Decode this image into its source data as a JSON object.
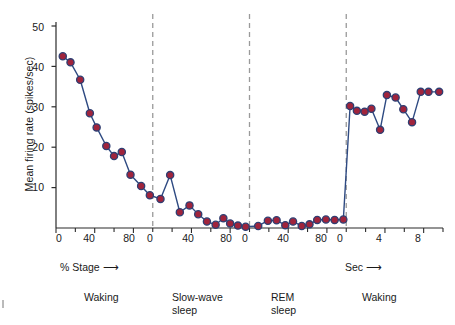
{
  "chart_data": {
    "type": "line",
    "title": "",
    "xlabel": "",
    "ylabel": "Mean firing rate (spikes/sec)",
    "ylim": [
      0,
      50
    ],
    "yticks": [
      10,
      20,
      30,
      40,
      50
    ],
    "grid": false,
    "legend": "none",
    "marker_style": "filled circle, crimson fill with navy edge",
    "line_style": "solid navy",
    "segments": [
      {
        "name": "Waking",
        "stage_label": "Waking",
        "axis_unit_label": "% Stage",
        "axis_arrow": true,
        "xlim": [
          0,
          100
        ],
        "xticks": [
          0,
          40,
          80
        ],
        "x": [
          7,
          15,
          25,
          35,
          42,
          52,
          60,
          68,
          77,
          88,
          97
        ],
        "y": [
          42.5,
          41.0,
          36.7,
          28.4,
          24.9,
          20.3,
          17.8,
          18.8,
          13.2,
          10.4,
          8.1
        ]
      },
      {
        "name": "Slow-wave sleep",
        "stage_label": "Slow-wave\nsleep",
        "axis_unit_label": "",
        "axis_arrow": false,
        "xlim": [
          0,
          100
        ],
        "xticks": [
          0,
          40,
          80
        ],
        "x": [
          8,
          18,
          28,
          38,
          47,
          56,
          65,
          73,
          80,
          88,
          96
        ],
        "y": [
          7.2,
          13.1,
          3.9,
          5.6,
          3.4,
          1.6,
          0.8,
          2.4,
          1.1,
          0.6,
          0.3
        ],
        "continues_from_previous": true
      },
      {
        "name": "REM sleep",
        "stage_label": "REM\nsleep",
        "axis_unit_label": "",
        "axis_arrow": false,
        "xlim": [
          0,
          100
        ],
        "xticks": [
          0,
          40,
          80
        ],
        "x": [
          9,
          19,
          28,
          37,
          45,
          54,
          62,
          70,
          79,
          88,
          97
        ],
        "y": [
          0.5,
          1.8,
          1.9,
          0.7,
          1.6,
          0.5,
          0.9,
          2.0,
          2.1,
          2.0,
          2.1
        ]
      },
      {
        "name": "Waking",
        "stage_label": "Waking",
        "axis_unit_label": "Sec",
        "axis_arrow": true,
        "xlim": [
          0,
          10
        ],
        "xticks": [
          0,
          4,
          8
        ],
        "x": [
          0.4,
          1.1,
          1.9,
          2.6,
          3.5,
          4.2,
          5.1,
          5.9,
          6.8,
          7.7,
          8.5,
          9.6
        ],
        "y": [
          30.2,
          29.0,
          28.8,
          29.5,
          24.3,
          32.9,
          32.3,
          29.4,
          26.2,
          33.7,
          33.7,
          33.7
        ],
        "stepped_entry": true
      }
    ],
    "dividers": {
      "style": "dashed",
      "color": "#9a9a9a",
      "count": 3
    },
    "colors": {
      "marker_fill": "#a0243c",
      "marker_edge": "#2e3f73",
      "line": "#2e4a82",
      "axis": "#2b2b2b",
      "divider": "#9a9a9a",
      "text": "#1a1a1a",
      "background": "#ffffff"
    }
  },
  "axis_notes": [
    {
      "text": "% Stage",
      "arrow": "⟶"
    },
    {
      "text": "Sec",
      "arrow": "⟶"
    }
  ]
}
